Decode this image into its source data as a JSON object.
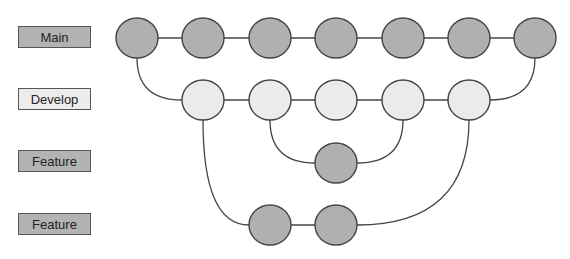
{
  "colors": {
    "dark_fill": "#b0b0b0",
    "light_fill": "#ebebeb",
    "stroke": "#444444"
  },
  "branches": [
    {
      "label": "Main",
      "style": "dark"
    },
    {
      "label": "Develop",
      "style": "light"
    },
    {
      "label": "Feature",
      "style": "dark"
    },
    {
      "label": "Feature",
      "style": "dark"
    }
  ],
  "commits": {
    "main": 7,
    "develop": 5,
    "feature_1": 1,
    "feature_2": 2
  }
}
